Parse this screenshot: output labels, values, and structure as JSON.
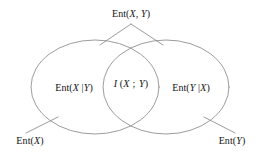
{
  "figure": {
    "kind": "venn-diagram",
    "title_text": "Ent(X, Y)",
    "stroke_color": "#8a8a8a",
    "background_color": "#ffffff",
    "text_color": "#141414"
  },
  "labels": {
    "joint_entropy": {
      "full": "Ent(X, Y)",
      "fn": "Ent(",
      "arg1": "X",
      "sep": ", ",
      "arg2": "Y",
      "close": ")"
    },
    "conditional_x_given_y": {
      "full": "Ent(X |Y)",
      "fn": "Ent(",
      "arg1": "X",
      "sep": " |",
      "arg2": "Y",
      "close": ")"
    },
    "mutual_information": {
      "full": "I (X ; Y)",
      "fn": "I",
      "open": " (",
      "arg1": "X",
      "sep": " ; ",
      "arg2": "Y",
      "close": ")"
    },
    "conditional_y_given_x": {
      "full": "Ent(Y |X)",
      "fn": "Ent(",
      "arg1": "Y",
      "sep": " |",
      "arg2": "X",
      "close": ")"
    },
    "entropy_x": {
      "full": "Ent(X)",
      "fn": "Ent(",
      "arg1": "X",
      "close": ")"
    },
    "entropy_y": {
      "full": "Ent(Y)",
      "fn": "Ent(",
      "arg1": "Y",
      "close": ")"
    }
  },
  "geometry": {
    "left_ellipse": {
      "cx": 95,
      "cy": 87,
      "rx": 64,
      "ry": 47
    },
    "right_ellipse": {
      "cx": 166,
      "cy": 87,
      "rx": 63,
      "ry": 47
    },
    "leader_joint_left": {
      "x1": 131,
      "y1": 24,
      "x2": 100,
      "y2": 45
    },
    "leader_joint_right": {
      "x1": 131,
      "y1": 24,
      "x2": 163,
      "y2": 45
    },
    "leader_entropy_x": {
      "x1": 26,
      "y1": 133,
      "x2": 58,
      "y2": 117
    },
    "leader_entropy_y": {
      "x1": 235,
      "y1": 133,
      "x2": 204,
      "y2": 117
    }
  }
}
